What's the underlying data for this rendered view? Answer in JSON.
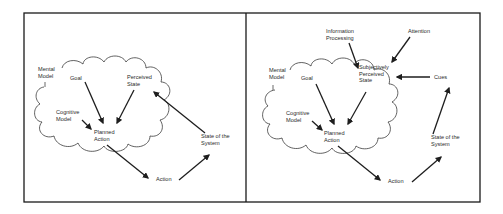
{
  "panels": [
    {
      "id": "left",
      "labels": {
        "mental_model": [
          "Mental",
          "Model"
        ],
        "goal": [
          "Goal"
        ],
        "perceived_state": [
          "Perceived",
          "State"
        ],
        "cognitive_model": [
          "Cognitive",
          "Model"
        ],
        "planned_action": [
          "Planned",
          "Action"
        ],
        "state_of_system": [
          "State of the",
          "System"
        ],
        "action": [
          "Action"
        ]
      }
    },
    {
      "id": "right",
      "labels": {
        "information_processing": [
          "Information",
          "Processing"
        ],
        "attention": [
          "Attention"
        ],
        "mental_model": [
          "Mental",
          "Model"
        ],
        "goal": [
          "Goal"
        ],
        "subjectively_perceived_state": [
          "Subjectively",
          "Perceived",
          "State"
        ],
        "cues": [
          "Cues"
        ],
        "cognitive_model": [
          "Cognitive",
          "Model"
        ],
        "planned_action": [
          "Planned",
          "Action"
        ],
        "state_of_system": [
          "State of the",
          "System"
        ],
        "action": [
          "Action"
        ]
      }
    }
  ],
  "colors": {
    "frame": "#1a1a1a",
    "cloud": "#3a3a3a",
    "arrow": "#1e1e1e",
    "text": "#2a2a2a",
    "background": "#ffffff"
  }
}
